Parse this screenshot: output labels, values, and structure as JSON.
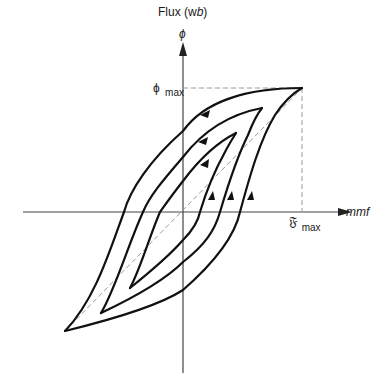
{
  "diagram": {
    "y_axis": {
      "label": "Flux (wb)",
      "label_plain": "Flux (w",
      "label_italic": "b",
      "label_close": ")",
      "symbol": "ϕ"
    },
    "x_axis": {
      "label": "mmf"
    },
    "markers": {
      "phi_max_symbol": "ϕ",
      "phi_max_sub": "max",
      "f_max_symbol": "𝔉",
      "f_max_sub": "max"
    },
    "loops": [
      {
        "name": "outer",
        "tip_top": [
          302,
          88
        ],
        "tip_bottom": [
          65,
          331
        ]
      },
      {
        "name": "middle",
        "tip_top": [
          262,
          108
        ],
        "tip_bottom": [
          101,
          313
        ]
      },
      {
        "name": "inner",
        "tip_top": [
          236,
          133
        ],
        "tip_bottom": [
          130,
          288
        ]
      }
    ],
    "colors": {
      "curve": "#111111",
      "axis": "#444444",
      "dashed": "#9a9a9a"
    }
  }
}
